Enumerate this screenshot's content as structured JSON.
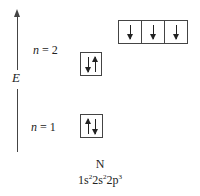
{
  "diagram": {
    "type": "orbital-energy-level-diagram",
    "axis": {
      "label": "E",
      "direction": "up"
    },
    "levels": [
      {
        "n_label": "n",
        "equals": " = 2",
        "orbitals": [
          {
            "name": "2s",
            "spins": [
              "down",
              "up"
            ]
          }
        ],
        "sub_orbitals": [
          {
            "name": "2p",
            "spins": [
              "down"
            ]
          },
          {
            "name": "2p",
            "spins": [
              "down"
            ]
          },
          {
            "name": "2p",
            "spins": [
              "down"
            ]
          }
        ]
      },
      {
        "n_label": "n",
        "equals": " = 1",
        "orbitals": [
          {
            "name": "1s",
            "spins": [
              "up",
              "down"
            ]
          }
        ]
      }
    ],
    "element": {
      "symbol": "N",
      "config_parts": [
        "1s",
        "2",
        "2s",
        "2",
        "2p",
        "3"
      ],
      "config_text": "1s²2s²2p³"
    }
  }
}
